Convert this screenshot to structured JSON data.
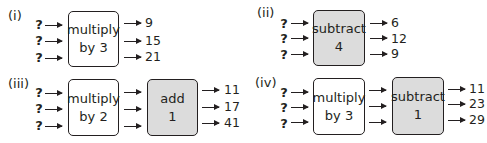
{
  "diagrams": [
    {
      "label": "(i)",
      "inputs": [
        "?",
        "?",
        "?"
      ],
      "machines": [
        {
          "line1": "multiply",
          "line2": "by 3",
          "fill": "#ffffff"
        }
      ],
      "outputs": [
        "9",
        "15",
        "21"
      ]
    },
    {
      "label": "(ii)",
      "inputs": [
        "?",
        "?",
        "?"
      ],
      "machines": [
        {
          "line1": "subtract",
          "line2": "4",
          "fill": "#dcdcdc"
        }
      ],
      "outputs": [
        "6",
        "12",
        "9"
      ]
    },
    {
      "label": "(iii)",
      "inputs": [
        "?",
        "?",
        "?"
      ],
      "machines": [
        {
          "line1": "multiply",
          "line2": "by 2",
          "fill": "#ffffff"
        },
        {
          "line1": "add",
          "line2": "1",
          "fill": "#dcdcdc"
        }
      ],
      "outputs": [
        "11",
        "17",
        "41"
      ]
    },
    {
      "label": "(iv)",
      "inputs": [
        "?",
        "?",
        "?"
      ],
      "machines": [
        {
          "line1": "multiply",
          "line2": "by 3",
          "fill": "#ffffff"
        },
        {
          "line1": "subtract",
          "line2": "1",
          "fill": "#dcdcdc"
        }
      ],
      "outputs": [
        "11",
        "23",
        "29"
      ]
    }
  ]
}
